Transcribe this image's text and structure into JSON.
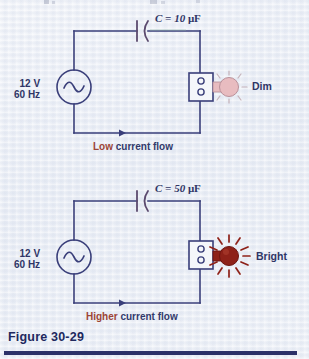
{
  "figure": {
    "caption": "Figure 30-29",
    "paper_color": "#eef1f7",
    "wire_color": "#3a3f7a",
    "accent_color": "#9c4436",
    "caption_color": "#21285e"
  },
  "circuits": [
    {
      "id": "top",
      "source": {
        "voltage": "12 V",
        "frequency": "60 Hz",
        "symbol": "ac-sine"
      },
      "capacitor": {
        "symbol": "C",
        "equals": "=",
        "value": "10",
        "unit": "μF",
        "full": "C = 10 μF"
      },
      "lamp": {
        "label": "Dim",
        "state": "dim",
        "bulb_color": "#e8bcc0",
        "ray_color": "#c9b3bb",
        "rays": 7
      },
      "flow": {
        "emphasis": "Low",
        "rest": "current flow",
        "full": "Low current flow",
        "direction": "right"
      }
    },
    {
      "id": "bottom",
      "source": {
        "voltage": "12 V",
        "frequency": "60 Hz",
        "symbol": "ac-sine"
      },
      "capacitor": {
        "symbol": "C",
        "equals": "=",
        "value": "50",
        "unit": "μF",
        "full": "C = 50 μF"
      },
      "lamp": {
        "label": "Bright",
        "state": "bright",
        "bulb_color": "#8e2118",
        "ray_color": "#8e2118",
        "rays": 11
      },
      "flow": {
        "emphasis": "Higher",
        "rest": "current flow",
        "full": "Higher current flow",
        "direction": "right"
      }
    }
  ]
}
